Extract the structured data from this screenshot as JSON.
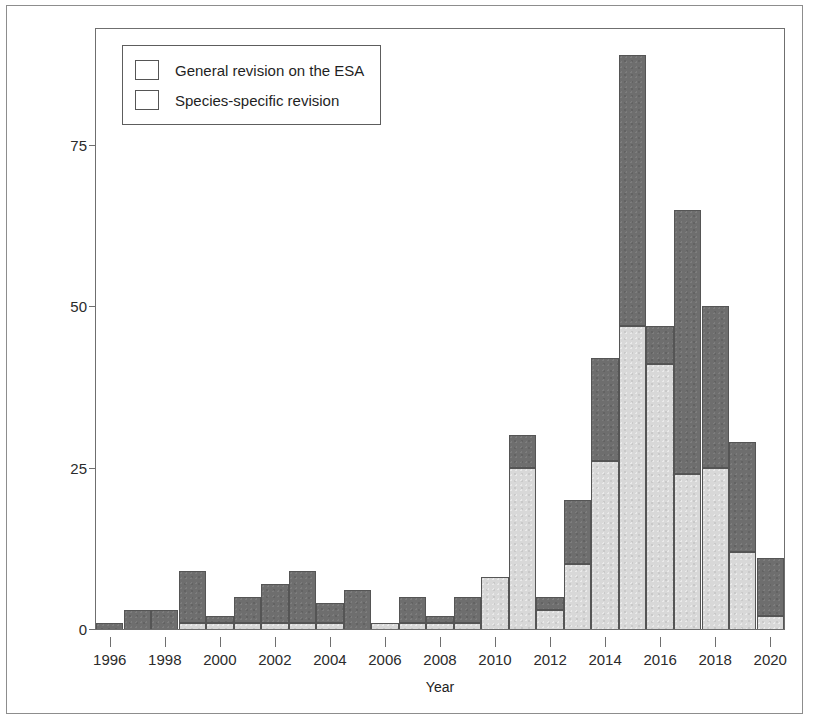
{
  "figure": {
    "y_axis_title": "# of Bills Introduced in Congress",
    "x_axis_title": "Year"
  },
  "legend": {
    "items": [
      {
        "label": "General revision on the ESA",
        "key": "general",
        "color": "#6e6e6e"
      },
      {
        "label": "Species-specific revision",
        "key": "species",
        "color": "#d8d8d8"
      }
    ]
  },
  "chart_data": {
    "type": "bar",
    "subtype": "stacked",
    "title": "",
    "xlabel": "Year",
    "ylabel": "# of Bills Introduced in Congress",
    "xlim": [
      1995.5,
      2020.5
    ],
    "ylim": [
      0,
      93
    ],
    "yticks": [
      0,
      25,
      50,
      75
    ],
    "ytick_labels": [
      "0",
      "25",
      "50",
      "75"
    ],
    "xticks": [
      1996,
      1998,
      2000,
      2002,
      2004,
      2006,
      2008,
      2010,
      2012,
      2014,
      2016,
      2018,
      2020
    ],
    "xtick_labels": [
      "1996",
      "1998",
      "2000",
      "2002",
      "2004",
      "2006",
      "2008",
      "2010",
      "2012",
      "2014",
      "2016",
      "2018",
      "2020"
    ],
    "grid": false,
    "legend_position": "upper left",
    "categories": [
      1996,
      1997,
      1998,
      1999,
      2000,
      2001,
      2002,
      2003,
      2004,
      2005,
      2006,
      2007,
      2008,
      2009,
      2010,
      2011,
      2012,
      2013,
      2014,
      2015,
      2016,
      2017,
      2018,
      2019,
      2020
    ],
    "series": [
      {
        "name": "Species-specific revision",
        "color": "#d8d8d8",
        "values": [
          0,
          0,
          0,
          1,
          1,
          1,
          1,
          1,
          1,
          0,
          1,
          1,
          1,
          1,
          8,
          25,
          3,
          10,
          26,
          47,
          41,
          24,
          25,
          12,
          2
        ]
      },
      {
        "name": "General revision on the ESA",
        "color": "#6e6e6e",
        "values": [
          1,
          3,
          3,
          8,
          1,
          4,
          6,
          8,
          3,
          6,
          0,
          4,
          1,
          4,
          0,
          5,
          2,
          10,
          16,
          42,
          6,
          41,
          25,
          17,
          9
        ]
      }
    ],
    "totals": [
      1,
      3,
      3,
      9,
      2,
      5,
      7,
      9,
      4,
      6,
      1,
      5,
      2,
      5,
      8,
      30,
      5,
      20,
      42,
      89,
      47,
      65,
      50,
      29,
      11
    ]
  }
}
